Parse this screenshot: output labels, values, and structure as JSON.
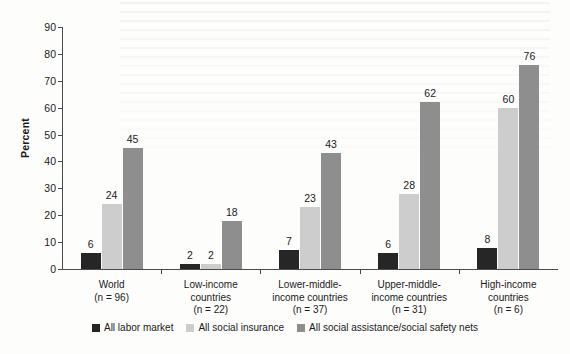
{
  "chart_data": {
    "type": "bar",
    "title": "",
    "subtitle": "",
    "xlabel": "",
    "ylabel": "Percent",
    "ylim": [
      0,
      90
    ],
    "yticks": [
      0,
      10,
      20,
      30,
      40,
      50,
      60,
      70,
      80,
      90
    ],
    "grid": false,
    "legend_position": "bottom",
    "categories": [
      "World\n(n = 96)",
      "Low-income\ncountries\n(n = 22)",
      "Lower-middle-\nincome countries\n(n = 37)",
      "Upper-middle-\nincome countries\n(n = 31)",
      "High-income\ncountries\n(n = 6)"
    ],
    "category_lines": [
      [
        "World",
        "(n = 96)"
      ],
      [
        "Low-income",
        "countries",
        "(n = 22)"
      ],
      [
        "Lower-middle-",
        "income countries",
        "(n = 37)"
      ],
      [
        "Upper-middle-",
        "income countries",
        "(n = 31)"
      ],
      [
        "High-income",
        "countries",
        "(n = 6)"
      ]
    ],
    "series": [
      {
        "name": "All labor market",
        "color": "#262626",
        "values": [
          6,
          2,
          7,
          6,
          8
        ]
      },
      {
        "name": "All social insurance",
        "color": "#cdcdcd",
        "values": [
          24,
          2,
          23,
          28,
          60
        ]
      },
      {
        "name": "All social assistance/social safety nets",
        "color": "#8e8e8e",
        "values": [
          45,
          18,
          43,
          62,
          76
        ]
      }
    ]
  },
  "axis": {
    "y_title": "Percent",
    "y_tick_labels": [
      "0",
      "10",
      "20",
      "30",
      "40",
      "50",
      "60",
      "70",
      "80",
      "90"
    ]
  },
  "legend": {
    "items": [
      {
        "label": "All labor market",
        "color": "#262626"
      },
      {
        "label": "All social insurance",
        "color": "#cdcdcd"
      },
      {
        "label": "All social assistance/social safety nets",
        "color": "#8e8e8e"
      }
    ]
  },
  "colors": {
    "labor_market": "#262626",
    "social_insurance": "#cdcdcd",
    "social_assistance": "#8e8e8e",
    "axis": "#4a4a4a",
    "text": "#1a1a1a",
    "background": "#fdfdfc"
  }
}
